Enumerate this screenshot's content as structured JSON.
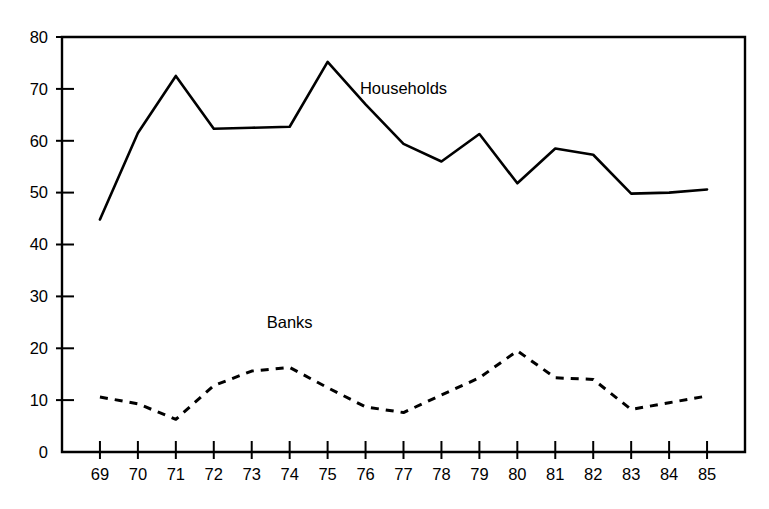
{
  "chart_data": {
    "type": "line",
    "title": "",
    "xlabel": "",
    "ylabel": "",
    "x": [
      "69",
      "70",
      "71",
      "72",
      "73",
      "74",
      "75",
      "76",
      "77",
      "78",
      "79",
      "80",
      "81",
      "82",
      "83",
      "84",
      "85"
    ],
    "categories": [
      "69",
      "70",
      "71",
      "72",
      "73",
      "74",
      "75",
      "76",
      "77",
      "78",
      "79",
      "80",
      "81",
      "82",
      "83",
      "84",
      "85"
    ],
    "series": [
      {
        "name": "Households",
        "style": "solid",
        "values": [
          44.8,
          61.5,
          72.5,
          62.3,
          62.5,
          62.7,
          75.2,
          67.0,
          59.4,
          56.0,
          61.3,
          51.8,
          58.5,
          57.3,
          49.8,
          50.0,
          50.6
        ]
      },
      {
        "name": "Banks",
        "style": "dashed",
        "values": [
          10.6,
          9.3,
          6.3,
          12.8,
          15.6,
          16.3,
          12.4,
          8.7,
          7.6,
          11.0,
          14.3,
          19.5,
          14.3,
          14.0,
          8.2,
          9.5,
          10.8
        ]
      }
    ],
    "ylim": [
      0,
      80
    ],
    "yticks": [
      0,
      10,
      20,
      30,
      40,
      50,
      60,
      70,
      80
    ],
    "ytick_labels": [
      "0",
      "10",
      "20",
      "30",
      "40",
      "50",
      "60",
      "70",
      "80"
    ],
    "grid": false,
    "legend": "inline-annotations",
    "annotations": [
      {
        "text": "Households",
        "x_value": "77",
        "y_value": 69.0
      },
      {
        "text": "Banks",
        "x_value": "74",
        "y_value": 24.0
      }
    ]
  },
  "figure": {
    "title_fragment": "",
    "background": "#ffffff",
    "ink_color": "#000000"
  }
}
